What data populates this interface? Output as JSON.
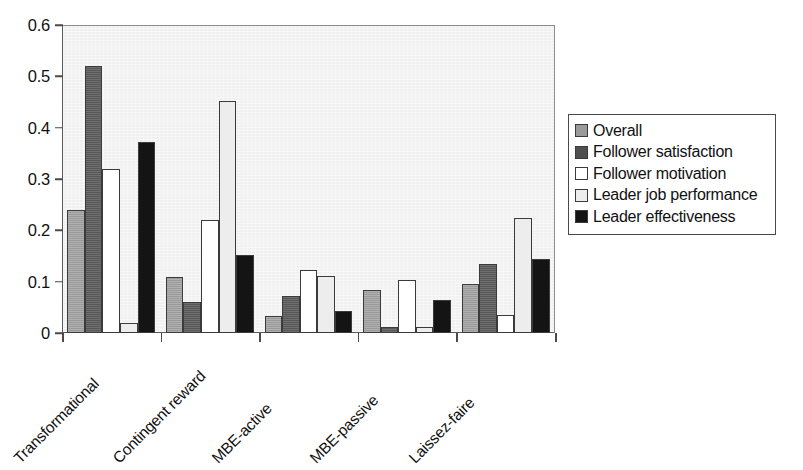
{
  "chart_data": {
    "type": "bar",
    "title": "",
    "subtitle": "",
    "xlabel": "",
    "ylabel": "",
    "ylim": [
      0,
      0.6
    ],
    "yticks": [
      "0",
      "0.1",
      "0.2",
      "0.3",
      "0.4",
      "0.5",
      "0.6"
    ],
    "ytick_values": [
      0,
      0.1,
      0.2,
      0.3,
      0.4,
      0.5,
      0.6
    ],
    "grid": false,
    "legend_position": "right",
    "categories": [
      "Transformational",
      "Contingent reward",
      "MBE-active",
      "MBE-passive",
      "Laissez-faire"
    ],
    "series": [
      {
        "name": "Overall",
        "color": "#9a9a9a",
        "values": [
          0.24,
          0.11,
          0.033,
          0.083,
          0.095
        ]
      },
      {
        "name": "Follower satisfaction",
        "color": "#4f4f4f",
        "values": [
          0.52,
          0.061,
          0.073,
          0.012,
          0.134
        ]
      },
      {
        "name": "Follower motivation",
        "color": "#ffffff",
        "values": [
          0.32,
          0.22,
          0.122,
          0.104,
          0.035
        ]
      },
      {
        "name": "Leader job performance",
        "color": "#ededed",
        "values": [
          0.019,
          0.452,
          0.112,
          0.012,
          0.224
        ]
      },
      {
        "name": "Leader effectiveness",
        "color": "#141414",
        "values": [
          0.372,
          0.152,
          0.043,
          0.065,
          0.144
        ]
      }
    ]
  },
  "legend": {
    "items": [
      "Overall",
      "Follower satisfaction",
      "Follower motivation",
      "Leader job performance",
      "Leader effectiveness"
    ]
  },
  "colors": {
    "plot_background": "#f1f1f1",
    "axis": "#4a4a4a",
    "bar_outline": "#3b3b3b",
    "page_background": "#ffffff"
  }
}
